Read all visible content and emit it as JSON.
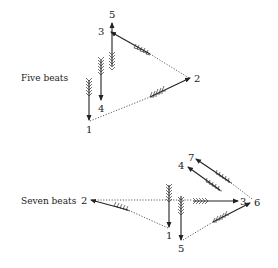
{
  "diagrams": [
    {
      "title": "Five beats",
      "beats": [
        "1",
        "2",
        "3",
        "4",
        "5"
      ]
    },
    {
      "title": "Seven beats",
      "beats": [
        "1",
        "2",
        "3",
        "4",
        "5",
        "6",
        "7"
      ]
    }
  ],
  "five": {
    "title": "Five beats",
    "labels": {
      "b1": "1",
      "b2": "2",
      "b3": "3",
      "b4": "4",
      "b5": "5"
    }
  },
  "seven": {
    "title": "Seven beats",
    "labels": {
      "b1": "1",
      "b2": "2",
      "b3": "3",
      "b4": "4",
      "b5": "5",
      "b6": "6",
      "b7": "7"
    }
  },
  "colors": {
    "ink": "#222222",
    "background": "#ffffff"
  }
}
